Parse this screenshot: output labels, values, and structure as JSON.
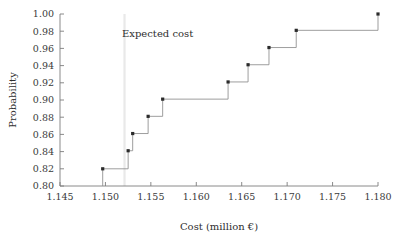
{
  "chart_data": {
    "type": "line",
    "title": "",
    "xlabel": "Cost (million €)",
    "ylabel": "Probability",
    "xlim": [
      1.145,
      1.18
    ],
    "ylim": [
      0.8,
      1.0
    ],
    "grid": false,
    "legend": null,
    "x_ticks": [
      "1.145",
      "1.150",
      "1.155",
      "1.160",
      "1.165",
      "1.170",
      "1.175",
      "1.180"
    ],
    "x_tick_values": [
      1.145,
      1.15,
      1.155,
      1.16,
      1.165,
      1.17,
      1.175,
      1.18
    ],
    "y_ticks": [
      "0.80",
      "0.82",
      "0.84",
      "0.86",
      "0.88",
      "0.90",
      "0.92",
      "0.94",
      "0.96",
      "0.98",
      "1.00"
    ],
    "y_tick_values": [
      0.8,
      0.82,
      0.84,
      0.86,
      0.88,
      0.9,
      0.92,
      0.94,
      0.96,
      0.98,
      1.0
    ],
    "series": [
      {
        "name": "Cumulative probability",
        "style": "step-post",
        "x": [
          1.1497,
          1.1525,
          1.153,
          1.1547,
          1.1563,
          1.1635,
          1.1657,
          1.168,
          1.171,
          1.18
        ],
        "y": [
          0.82,
          0.841,
          0.861,
          0.881,
          0.901,
          0.921,
          0.941,
          0.961,
          0.981,
          1.0
        ]
      }
    ],
    "annotations": [
      {
        "name": "expected-cost",
        "label": "Expected cost",
        "type": "vline",
        "x": 1.1521,
        "label_x": 1.1535,
        "label_y": 0.982,
        "color": "#e9e9e9"
      }
    ]
  },
  "colors": {
    "axis": "#7d7d7d",
    "line": "#8d8d8d",
    "marker": "#2b2b2b",
    "text": "#2e2e2e",
    "background": "#ffffff"
  }
}
